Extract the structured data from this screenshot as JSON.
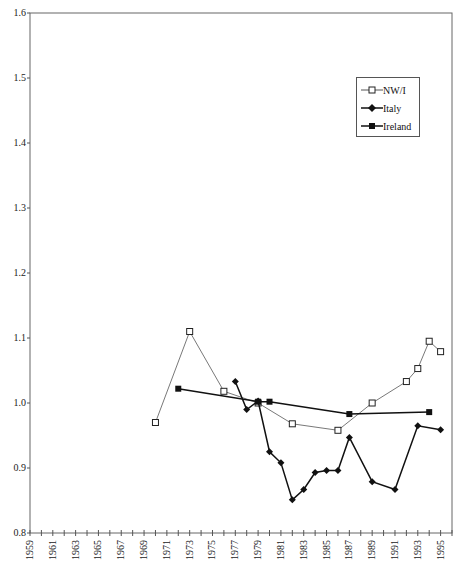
{
  "chart_data": {
    "type": "line",
    "title": "",
    "xlabel": "",
    "ylabel": "",
    "ylim": [
      0.8,
      1.6
    ],
    "yticks": [
      "0.8",
      "0.9",
      "1.0",
      "1.1",
      "1.2",
      "1.3",
      "1.4",
      "1.5",
      "1.6"
    ],
    "xlim": [
      1959,
      1996
    ],
    "xticks": [
      "1959",
      "1961",
      "1963",
      "1965",
      "1967",
      "1969",
      "1971",
      "1973",
      "1975",
      "1977",
      "1979",
      "1981",
      "1983",
      "1985",
      "1987",
      "1989",
      "1991",
      "1993",
      "1995"
    ],
    "grid": false,
    "legend_position": "upper right",
    "series": [
      {
        "name": "NW/I",
        "marker": "open-square",
        "color": "#555555",
        "x": [
          1970,
          1973,
          1976,
          1979,
          1982,
          1986,
          1989,
          1992,
          1993,
          1994,
          1995
        ],
        "y": [
          0.97,
          1.11,
          1.018,
          1.0,
          0.968,
          0.958,
          1.0,
          1.033,
          1.053,
          1.095,
          1.079
        ]
      },
      {
        "name": "Italy",
        "marker": "diamond",
        "color": "#111111",
        "x": [
          1977,
          1978,
          1979,
          1980,
          1981,
          1982,
          1983,
          1984,
          1985,
          1986,
          1987,
          1989,
          1991,
          1993,
          1995
        ],
        "y": [
          1.033,
          0.99,
          1.003,
          0.925,
          0.908,
          0.851,
          0.867,
          0.893,
          0.896,
          0.896,
          0.947,
          0.879,
          0.867,
          0.965,
          0.959
        ]
      },
      {
        "name": "Ireland",
        "marker": "filled-square",
        "color": "#111111",
        "x": [
          1972,
          1979,
          1980,
          1987,
          1994
        ],
        "y": [
          1.022,
          1.002,
          1.002,
          0.983,
          0.986
        ]
      }
    ]
  },
  "legend": {
    "items": [
      {
        "label": "NW/I"
      },
      {
        "label": "Italy"
      },
      {
        "label": "Ireland"
      }
    ]
  }
}
